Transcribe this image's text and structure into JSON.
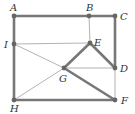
{
  "diagram": {
    "colors": {
      "thick": "#777777",
      "thin": "#aaaaaa",
      "node": "#666666",
      "label": "#333333"
    },
    "nodes": [
      {
        "id": "A",
        "label": "A",
        "x": 14,
        "y": 16,
        "lx": 10,
        "ly": 11
      },
      {
        "id": "B",
        "label": "B",
        "x": 89,
        "y": 16,
        "lx": 86,
        "ly": 11
      },
      {
        "id": "C",
        "label": "C",
        "x": 115,
        "y": 16,
        "lx": 120,
        "ly": 20
      },
      {
        "id": "I",
        "label": "I",
        "x": 14,
        "y": 44,
        "lx": 4,
        "ly": 48
      },
      {
        "id": "E",
        "label": "E",
        "x": 90,
        "y": 43,
        "lx": 94,
        "ly": 46
      },
      {
        "id": "G",
        "label": "G",
        "x": 64,
        "y": 68,
        "lx": 59,
        "ly": 82
      },
      {
        "id": "D",
        "label": "D",
        "x": 115,
        "y": 68,
        "lx": 120,
        "ly": 72
      },
      {
        "id": "H",
        "label": "H",
        "x": 14,
        "y": 100,
        "lx": 10,
        "ly": 112
      },
      {
        "id": "F",
        "label": "F",
        "x": 115,
        "y": 100,
        "lx": 121,
        "ly": 104
      }
    ],
    "edges": [
      {
        "from": "A",
        "to": "C",
        "weight": "thick"
      },
      {
        "from": "A",
        "to": "H",
        "weight": "thick"
      },
      {
        "from": "H",
        "to": "F",
        "weight": "thick"
      },
      {
        "from": "C",
        "to": "D",
        "weight": "thick"
      },
      {
        "from": "E",
        "to": "G",
        "weight": "thick"
      },
      {
        "from": "E",
        "to": "D",
        "weight": "thick"
      },
      {
        "from": "G",
        "to": "F",
        "weight": "thick"
      },
      {
        "from": "B",
        "to": "E",
        "weight": "thin"
      },
      {
        "from": "I",
        "to": "E",
        "weight": "thin"
      },
      {
        "from": "I",
        "to": "G",
        "weight": "thin"
      },
      {
        "from": "G",
        "to": "D",
        "weight": "thin"
      },
      {
        "from": "H",
        "to": "G",
        "weight": "thin"
      },
      {
        "from": "D",
        "to": "F",
        "weight": "thin"
      }
    ]
  }
}
